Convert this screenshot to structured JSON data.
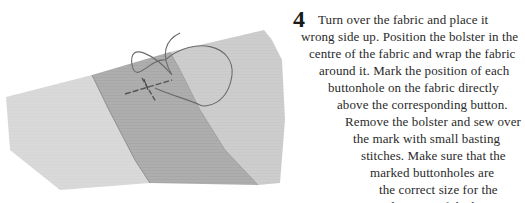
{
  "illustration": {
    "subject": "fabric-with-basting-stitch-and-thread",
    "colors": {
      "light_panel": "#d4d4d4",
      "dark_panel": "#a9a9a9",
      "right_panel": "#c8c8c8",
      "thread": "#6b6b6b"
    }
  },
  "instruction": {
    "step_number": "4",
    "lines": [
      "Turn over the fabric and place it",
      "wrong side up. Position the bolster in the",
      "centre of the fabric and wrap the fabric",
      "around it. Mark the position of each",
      "buttonhole on the fabric directly",
      "above the corresponding button.",
      "Remove the bolster and sew over",
      "the mark with small basting",
      "stitches. Make sure that the",
      "marked buttonholes are",
      "the correct size for the",
      "diameter of the buttons."
    ]
  }
}
